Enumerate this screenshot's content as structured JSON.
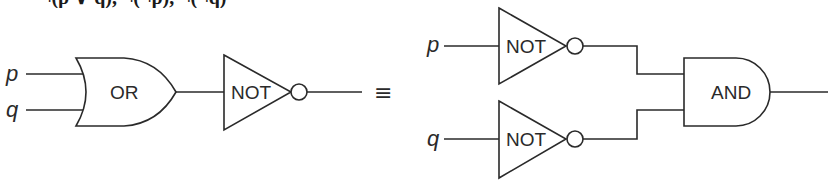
{
  "diagram": {
    "type": "logic-circuit-equivalence",
    "title_cutoff": "¬(p ∨ q), ¬(¬p), ¬(¬q)",
    "left_circuit": {
      "inputs": [
        "p",
        "q"
      ],
      "gates": [
        {
          "id": "or1",
          "label": "OR"
        },
        {
          "id": "not1",
          "label": "NOT"
        }
      ]
    },
    "equivalence_symbol": "≡",
    "right_circuit": {
      "inputs": [
        "p",
        "q"
      ],
      "gates": [
        {
          "id": "not_p",
          "label": "NOT"
        },
        {
          "id": "not_q",
          "label": "NOT"
        },
        {
          "id": "and1",
          "label": "AND"
        }
      ]
    }
  }
}
